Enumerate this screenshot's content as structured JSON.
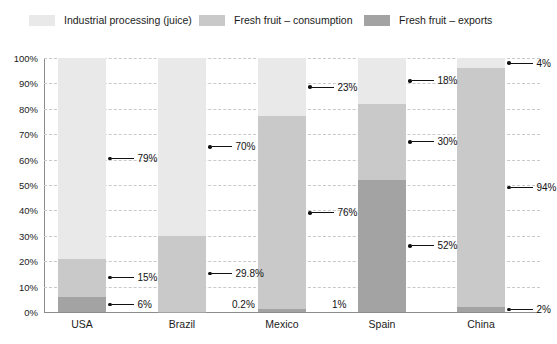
{
  "legend": {
    "items": [
      {
        "label": "Industrial processing (juice)",
        "color": "#e9e9e9",
        "key": "industrial"
      },
      {
        "label": "Fresh fruit – consumption",
        "color": "#c9c9c9",
        "key": "consumption"
      },
      {
        "label": "Fresh fruit – exports",
        "color": "#a3a3a3",
        "key": "exports"
      }
    ]
  },
  "axis": {
    "yticks": [
      "0%",
      "10%",
      "20%",
      "30%",
      "40%",
      "50%",
      "60%",
      "70%",
      "80%",
      "90%",
      "100%"
    ],
    "ymin": 0,
    "ymax": 100
  },
  "chart_data": {
    "type": "bar",
    "subtype": "stacked-percent-bar",
    "title": "",
    "subtitle": "",
    "xlabel": "",
    "ylabel": "",
    "ylim": [
      0,
      100
    ],
    "ytick_labels": [
      "0%",
      "10%",
      "20%",
      "30%",
      "40%",
      "50%",
      "60%",
      "70%",
      "80%",
      "90%",
      "100%"
    ],
    "grid": true,
    "grid_style": "dashed-horizontal",
    "legend_position": "top",
    "stack_order_bottom_to_top": [
      "exports",
      "consumption",
      "industrial"
    ],
    "categories": [
      "USA",
      "Brazil",
      "Mexico",
      "Spain",
      "China"
    ],
    "series": [
      {
        "name": "Fresh fruit – exports",
        "key": "exports",
        "color": "#a3a3a3",
        "values": [
          6,
          0.2,
          1,
          52,
          2
        ],
        "labels": [
          "6%",
          "0.2%",
          "1%",
          "52%",
          "2%"
        ]
      },
      {
        "name": "Fresh fruit – consumption",
        "key": "consumption",
        "color": "#c9c9c9",
        "values": [
          15,
          29.8,
          76,
          30,
          94
        ],
        "labels": [
          "15%",
          "29.8%",
          "76%",
          "30%",
          "94%"
        ]
      },
      {
        "name": "Industrial processing (juice)",
        "key": "industrial",
        "color": "#e9e9e9",
        "values": [
          79,
          70,
          23,
          18,
          4
        ],
        "labels": [
          "79%",
          "70%",
          "23%",
          "18%",
          "4%"
        ]
      }
    ]
  },
  "bars": [
    {
      "name": "USA",
      "exports": {
        "value": 6,
        "label": "6%"
      },
      "consumption": {
        "value": 15,
        "label": "15%"
      },
      "industrial": {
        "value": 79,
        "label": "79%"
      }
    },
    {
      "name": "Brazil",
      "exports": {
        "value": 0.2,
        "label": "0.2%"
      },
      "consumption": {
        "value": 29.8,
        "label": "29.8%"
      },
      "industrial": {
        "value": 70,
        "label": "70%"
      }
    },
    {
      "name": "Mexico",
      "exports": {
        "value": 1,
        "label": "1%"
      },
      "consumption": {
        "value": 76,
        "label": "76%"
      },
      "industrial": {
        "value": 23,
        "label": "23%"
      }
    },
    {
      "name": "Spain",
      "exports": {
        "value": 52,
        "label": "52%"
      },
      "consumption": {
        "value": 30,
        "label": "30%"
      },
      "industrial": {
        "value": 18,
        "label": "18%"
      }
    },
    {
      "name": "China",
      "exports": {
        "value": 2,
        "label": "2%"
      },
      "consumption": {
        "value": 94,
        "label": "94%"
      },
      "industrial": {
        "value": 4,
        "label": "4%"
      }
    }
  ]
}
